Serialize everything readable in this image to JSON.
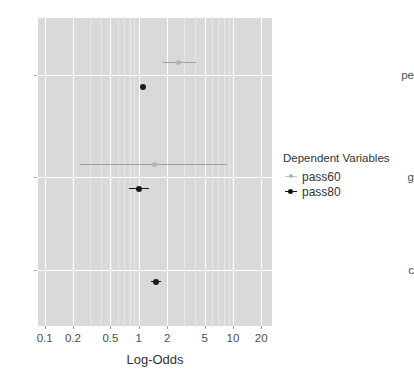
{
  "chart_data": {
    "type": "scatter",
    "title": "",
    "xlabel": "Log-Odds",
    "ylabel": "",
    "xscale": "log",
    "xlim": [
      0.085,
      26
    ],
    "xticks": [
      0.1,
      0.2,
      0.5,
      1,
      2,
      5,
      10,
      20
    ],
    "xticklabels": [
      "0.1",
      "0.2",
      "0.5",
      "1",
      "2",
      "5",
      "10",
      "20"
    ],
    "categories": [
      "pe",
      "g",
      "c"
    ],
    "grid": true,
    "legend": {
      "title": "Dependent Variables",
      "position": "right",
      "entries": [
        {
          "name": "pass60",
          "color": "#b3b3b3"
        },
        {
          "name": "pass80",
          "color": "#1a1a1a"
        }
      ]
    },
    "series": [
      {
        "name": "pass60",
        "color": "#b3b3b3",
        "points": [
          {
            "category": "pe",
            "estimate": 2.63,
            "low": 1.82,
            "high": 4.05
          },
          {
            "category": "g",
            "estimate": 1.47,
            "low": 0.24,
            "high": 8.7
          }
        ]
      },
      {
        "name": "pass80",
        "color": "#1a1a1a",
        "points": [
          {
            "category": "pe",
            "estimate": 1.12,
            "low": 1.06,
            "high": 1.19
          },
          {
            "category": "g",
            "estimate": 1.01,
            "low": 0.79,
            "high": 1.28
          },
          {
            "category": "c",
            "estimate": 1.52,
            "low": 1.36,
            "high": 1.72
          }
        ]
      }
    ]
  },
  "axis": {
    "x_title": "Log-Odds",
    "tick_labels": [
      "0.1",
      "0.2",
      "0.5",
      "1",
      "2",
      "5",
      "10",
      "20"
    ],
    "category_labels": [
      "pe",
      "g",
      "c"
    ]
  },
  "legend": {
    "title": "Dependent Variables",
    "items": [
      {
        "label": "pass60"
      },
      {
        "label": "pass80"
      }
    ]
  },
  "colors": {
    "panel": "#d9d9d9",
    "grid_major": "#ffffff",
    "grid_minor": "#e8e8e8",
    "pass60": "#b3b3b3",
    "pass80": "#1a1a1a",
    "text": "#4d4d4d"
  }
}
